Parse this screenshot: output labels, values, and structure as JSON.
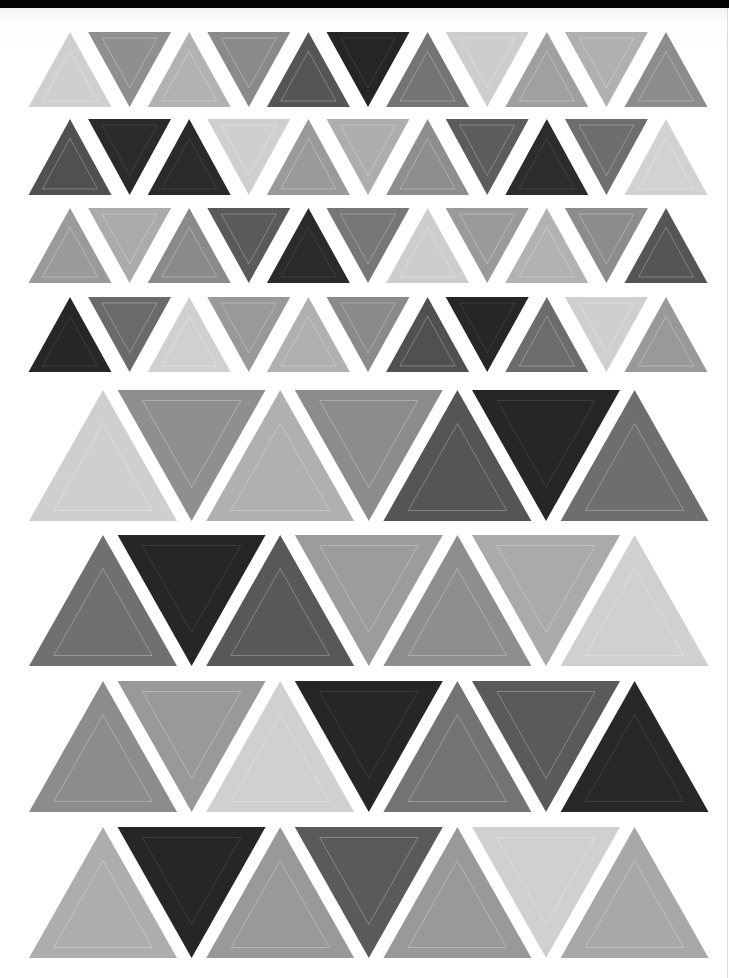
{
  "page": {
    "background": "#ffffff",
    "top_bar_color": "#050505"
  },
  "palette": {
    "black": "#262626",
    "dark": "#565656",
    "mid_dark": "#727272",
    "mid": "#8e8e8e",
    "mid_light": "#9c9c9c",
    "light_mid": "#afafaf",
    "light": "#cfcfcf"
  },
  "small_rows": {
    "first_apex_x": 70,
    "step_x": 59.6,
    "half_width": 41.5,
    "rows": [
      {
        "y_top": 32,
        "y_bottom": 107,
        "first": "up",
        "colors": [
          "#cfcfcf",
          "#8f8f8f",
          "#b2b2b2",
          "#8a8a8a",
          "#555555",
          "#252525",
          "#747474",
          "#cdcdcd",
          "#a0a0a0",
          "#b0b0b0",
          "#8c8c8c"
        ]
      },
      {
        "y_top": 119,
        "y_bottom": 195,
        "first": "up",
        "colors": [
          "#505050",
          "#2a2a2a",
          "#2a2a2a",
          "#cfcfcf",
          "#9a9a9a",
          "#adadad",
          "#8e8e8e",
          "#5c5c5c",
          "#2c2c2c",
          "#6e6e6e",
          "#d2d2d2"
        ]
      },
      {
        "y_top": 208,
        "y_bottom": 283,
        "first": "up",
        "colors": [
          "#9a9a9a",
          "#ababab",
          "#8a8a8a",
          "#5a5a5a",
          "#2a2a2a",
          "#777777",
          "#cdcdcd",
          "#9a9a9a",
          "#b2b2b2",
          "#8c8c8c",
          "#555555"
        ]
      },
      {
        "y_top": 297,
        "y_bottom": 372,
        "first": "up",
        "colors": [
          "#272727",
          "#6a6a6a",
          "#d0d0d0",
          "#999999",
          "#b0b0b0",
          "#8a8a8a",
          "#505050",
          "#262626",
          "#6c6c6c",
          "#cfcfcf",
          "#999999"
        ]
      }
    ]
  },
  "large_rows": {
    "first_apex_x": 103,
    "step_x": 88.6,
    "half_width": 74,
    "rows": [
      {
        "y_top": 390,
        "y_bottom": 521,
        "first": "up",
        "colors": [
          "#cfcfcf",
          "#8f8f8f",
          "#b0b0b0",
          "#8c8c8c",
          "#555555",
          "#262626",
          "#6e6e6e"
        ]
      },
      {
        "y_top": 535,
        "y_bottom": 666,
        "first": "up",
        "colors": [
          "#707070",
          "#262626",
          "#585858",
          "#9c9c9c",
          "#8e8e8e",
          "#aaaaaa",
          "#d0d0d0"
        ]
      },
      {
        "y_top": 681,
        "y_bottom": 812,
        "first": "up",
        "colors": [
          "#8c8c8c",
          "#999999",
          "#d0d0d0",
          "#262626",
          "#737373",
          "#5a5a5a",
          "#282828"
        ]
      },
      {
        "y_top": 827,
        "y_bottom": 958,
        "first": "up",
        "colors": [
          "#adadad",
          "#262626",
          "#999999",
          "#5a5a5a",
          "#999999",
          "#d0d0d0",
          "#a8a8a8"
        ]
      }
    ]
  }
}
